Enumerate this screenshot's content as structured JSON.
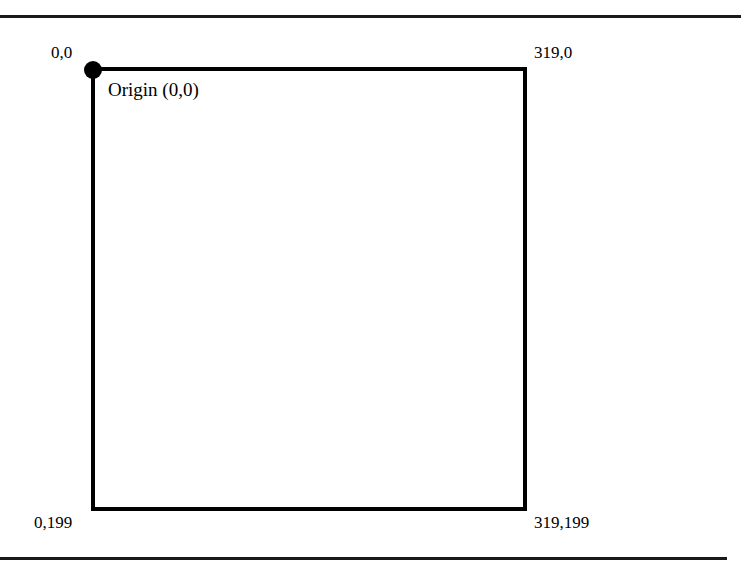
{
  "figure": {
    "kind": "screen-coordinate-diagram",
    "background_color": "#ffffff",
    "ink_color": "#000000",
    "rules": {
      "top_label": "",
      "bottom_label": ""
    },
    "origin_marker": {
      "name": "origin-dot",
      "caption": "Origin (0,0)"
    },
    "corner_labels": {
      "top_left": "0,0",
      "top_right": "319,0",
      "bottom_left": "0,199",
      "bottom_right": "319,199"
    }
  }
}
